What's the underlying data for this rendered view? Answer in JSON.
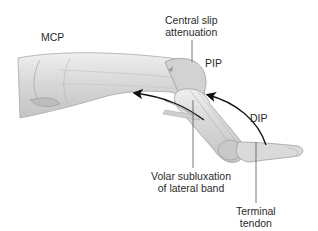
{
  "diagram": {
    "labels": {
      "mcp": "MCP",
      "central_slip_line1": "Central slip",
      "central_slip_line2": "attenuation",
      "pip": "PIP",
      "dip": "DIP",
      "volar_line1": "Volar subluxation",
      "volar_line2": "of lateral band",
      "terminal_line1": "Terminal",
      "terminal_line2": "tendon"
    },
    "colors": {
      "finger_fill": "#d9d9d9",
      "finger_shade": "#bdbdbd",
      "finger_outline": "#9a9a9a",
      "arrow": "#111111",
      "leader_line": "#555555",
      "text": "#2b2b2b"
    },
    "arrows": [
      {
        "name": "lateral-band-arrow",
        "direction": "toward proximal (left)"
      },
      {
        "name": "dip-arrow",
        "direction": "from DIP toward PIP"
      }
    ]
  }
}
